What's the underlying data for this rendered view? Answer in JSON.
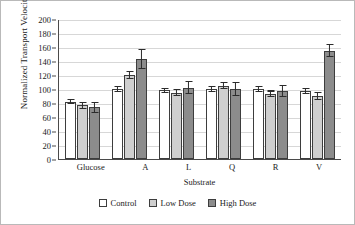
{
  "chart_data": {
    "type": "bar",
    "title": "",
    "xlabel": "Substrate",
    "ylabel": "Normalized Transport Velocity",
    "categories": [
      "Glucose",
      "A",
      "L",
      "Q",
      "R",
      "V"
    ],
    "ylim": [
      0,
      200
    ],
    "ytick_step": 20,
    "yticks": [
      0,
      20,
      40,
      60,
      80,
      100,
      120,
      140,
      160,
      180,
      200
    ],
    "grid": "horizontal",
    "legend_position": "bottom-center",
    "series": [
      {
        "name": "Control",
        "color": "#ffffff",
        "values": [
          82,
          100,
          98,
          100,
          100,
          97
        ],
        "errors": [
          4,
          4,
          4,
          4,
          4,
          4
        ]
      },
      {
        "name": "Low Dose",
        "color": "#cfcfcf",
        "values": [
          77,
          120,
          95,
          105,
          93,
          90
        ],
        "errors": [
          5,
          6,
          5,
          5,
          5,
          6
        ]
      },
      {
        "name": "High Dose",
        "color": "#8c8c8c",
        "values": [
          74,
          143,
          102,
          100,
          97,
          155
        ],
        "errors": [
          8,
          14,
          9,
          10,
          9,
          9
        ]
      }
    ]
  }
}
